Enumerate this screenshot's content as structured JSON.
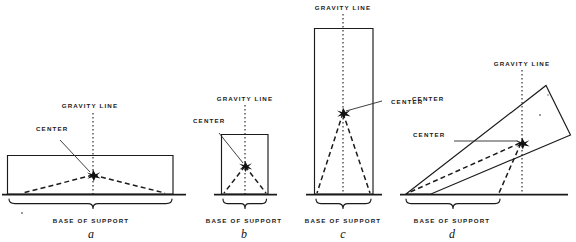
{
  "diagram": {
    "ink_color": "#1b1b1b",
    "background": "#ffffff",
    "labels": {
      "gravity_line": "GRAVITY LINE",
      "center": "CENTER",
      "of_gravity": "OF GRAVITY",
      "base_of_support": "BASE OF SUPPORT"
    },
    "figures": [
      {
        "id": "a",
        "letter": "a",
        "shape": "wide-rectangle",
        "gravity_line_label": "GRAVITY LINE",
        "center_label_line1": "CENTER",
        "center_label_line2": "OF GRAVITY",
        "base_label": "BASE OF SUPPORT"
      },
      {
        "id": "b",
        "letter": "b",
        "shape": "small-rectangle",
        "gravity_line_label": "GRAVITY LINE",
        "center_label_line1": "CENTER",
        "center_label_line2": "OF GRAVITY",
        "base_label": "BASE OF SUPPORT"
      },
      {
        "id": "c",
        "letter": "c",
        "shape": "tall-rectangle",
        "gravity_line_label": "GRAVITY LINE",
        "center_label_line1": "CENTER",
        "center_label_line2": "OF GRAVITY",
        "base_label": "BASE OF SUPPORT"
      },
      {
        "id": "d",
        "letter": "d",
        "shape": "tilted-rectangle",
        "gravity_line_label": "GRAVITY LINE",
        "center_label_line1": "CENTER",
        "center_label_line2": "OF GRAVITY",
        "base_label": "BASE OF SUPPORT"
      }
    ]
  }
}
